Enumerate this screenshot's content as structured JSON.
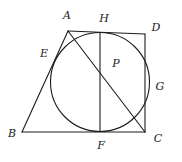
{
  "figure": {
    "stroke_color": "#1c1c1c",
    "background_color": "#ffffff",
    "label_color": "#1a1a1a",
    "stroke_width": 1.1,
    "circle": {
      "name": "inscribed-circle",
      "cx": 100,
      "cy": 82,
      "r": 49.5
    },
    "points": [
      {
        "id": "A",
        "label": "A",
        "x": 68,
        "y": 31,
        "label_x": 67,
        "label_y": 16,
        "kind": "vertex"
      },
      {
        "id": "B",
        "label": "B",
        "x": 22,
        "y": 132,
        "label_x": 12,
        "label_y": 134,
        "kind": "vertex"
      },
      {
        "id": "C",
        "label": "C",
        "x": 145,
        "y": 132,
        "label_x": 158,
        "label_y": 139,
        "kind": "vertex"
      },
      {
        "id": "D",
        "label": "D",
        "x": 145,
        "y": 34,
        "label_x": 156,
        "label_y": 28,
        "kind": "vertex"
      },
      {
        "id": "E",
        "label": "E",
        "x": 55,
        "y": 62,
        "label_x": 44,
        "label_y": 54,
        "kind": "tangent-point"
      },
      {
        "id": "F",
        "label": "F",
        "x": 100,
        "y": 131,
        "label_x": 101,
        "label_y": 146,
        "kind": "tangent-point"
      },
      {
        "id": "G",
        "label": "G",
        "x": 149,
        "y": 84,
        "label_x": 160,
        "label_y": 87,
        "kind": "tangent-point"
      },
      {
        "id": "H",
        "label": "H",
        "x": 100,
        "y": 33,
        "label_x": 104,
        "label_y": 19,
        "kind": "tangent-point"
      },
      {
        "id": "P",
        "label": "P",
        "x": 107,
        "y": 72,
        "label_x": 116,
        "label_y": 64,
        "kind": "intersection-point"
      }
    ],
    "segments": [
      {
        "name": "segment-A-B",
        "from": "A",
        "to": "B"
      },
      {
        "name": "segment-B-C",
        "from": "B",
        "to": "C"
      },
      {
        "name": "segment-C-D",
        "from": "C",
        "to": "D"
      },
      {
        "name": "segment-A-D",
        "from": "A",
        "to": "D"
      },
      {
        "name": "segment-A-C",
        "from": "A",
        "to": "C"
      },
      {
        "name": "segment-H-F",
        "from": "H",
        "to": "F"
      }
    ]
  }
}
